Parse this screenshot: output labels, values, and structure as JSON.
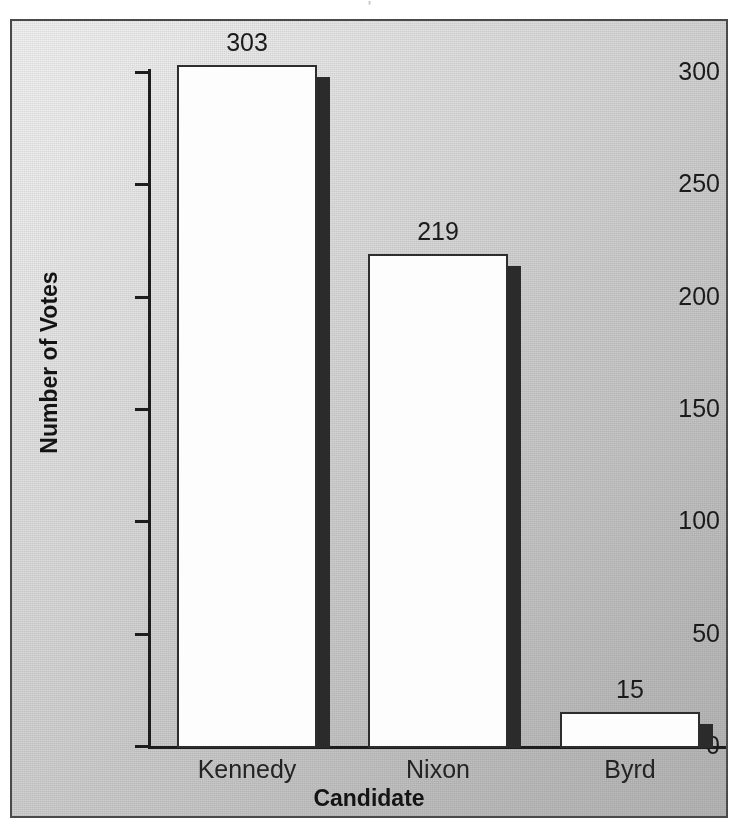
{
  "figure": {
    "title_remnant": "'",
    "frame_border_color": "#4a4a4a",
    "background_light": "#f2f2f2",
    "background_dark": "#b6b6b6"
  },
  "chart_data": {
    "type": "bar",
    "title": "",
    "subtitle": "",
    "xlabel": "Candidate",
    "ylabel": "Number of Votes",
    "categories": [
      "Kennedy",
      "Nixon",
      "Byrd"
    ],
    "values": [
      303,
      219,
      15
    ],
    "value_labels": [
      "303",
      "219",
      "15"
    ],
    "ylim": [
      0,
      300
    ],
    "y_ticks": [
      0,
      50,
      100,
      150,
      200,
      250,
      300
    ],
    "y_tick_labels": [
      "0",
      "50",
      "100",
      "150",
      "200",
      "250",
      "300"
    ],
    "grid": false,
    "legend": null,
    "bar_fill_color": "#fdfdfd",
    "bar_edge_color": "#2e2e2e",
    "bar_shadow_color": "#2b2b2b",
    "annotations": [
      "303",
      "219",
      "15"
    ]
  }
}
